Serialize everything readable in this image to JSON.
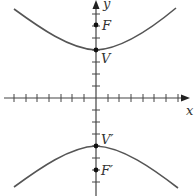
{
  "diagram": {
    "type": "hyperbola",
    "axes": {
      "x_label": "x",
      "y_label": "y",
      "x_ticks_each_side": 7,
      "y_ticks_each_side": 7
    },
    "points": [
      {
        "name": "F",
        "label": "F",
        "role": "focus (upper)"
      },
      {
        "name": "V",
        "label": "V",
        "role": "vertex (upper)"
      },
      {
        "name": "V'",
        "label": "V′",
        "role": "vertex (lower)"
      },
      {
        "name": "F'",
        "label": "F′",
        "role": "focus (lower)"
      }
    ],
    "colors": {
      "curve": "#555555",
      "axes": "#444444",
      "points": "#111111"
    }
  }
}
